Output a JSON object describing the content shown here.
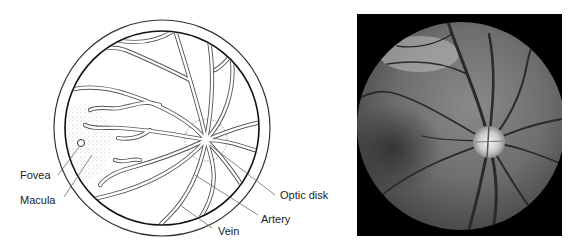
{
  "figure": {
    "left_panel": {
      "type": "schematic-drawing",
      "subject": "retina fundus diagram",
      "labels": [
        {
          "id": "fovea",
          "text": "Fovea"
        },
        {
          "id": "macula",
          "text": "Macula"
        },
        {
          "id": "optic_disk",
          "text": "Optic disk"
        },
        {
          "id": "artery",
          "text": "Artery"
        },
        {
          "id": "vein",
          "text": "Vein"
        }
      ]
    },
    "right_panel": {
      "type": "photograph",
      "subject": "fundus photograph (grayscale)"
    },
    "colors": {
      "line": "#333333",
      "vessel": "#555555",
      "background": "#ffffff",
      "photo_bg": "#000000"
    }
  }
}
